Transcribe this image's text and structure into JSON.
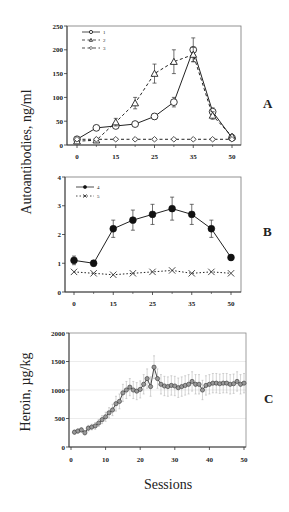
{
  "figure": {
    "ylabel_top": "Autoantibodies, ng/ml",
    "ylabel_bottom": "Heroin, µg/kg",
    "xlabel": "Sessions",
    "panel_letters": [
      "A",
      "B",
      "C"
    ]
  },
  "chart_data": [
    {
      "panel": "A",
      "type": "line",
      "title": "",
      "xlabel": "",
      "ylabel": "Autoantibodies, ng/ml",
      "ylim": [
        0,
        250
      ],
      "yticks": [
        0,
        50,
        100,
        150,
        200,
        250
      ],
      "xtick_labels": [
        "0",
        "15",
        "25",
        "35",
        "50"
      ],
      "xtick_positions": [
        0,
        2,
        4,
        6,
        8
      ],
      "n_points": 9,
      "grid": false,
      "legend_position": "upper left",
      "series": [
        {
          "name": "1",
          "marker": "open-circle",
          "line": "solid",
          "values": [
            12,
            36,
            40,
            44,
            60,
            90,
            200,
            70,
            15
          ],
          "errors": [
            4,
            4,
            5,
            4,
            6,
            10,
            25,
            8,
            4
          ]
        },
        {
          "name": "2",
          "marker": "open-triangle",
          "line": "dashed",
          "values": [
            8,
            10,
            48,
            88,
            150,
            175,
            190,
            62,
            18
          ],
          "errors": [
            3,
            3,
            8,
            12,
            20,
            25,
            15,
            8,
            4
          ]
        },
        {
          "name": "3",
          "marker": "filled-diamond",
          "line": "dashed",
          "values": [
            12,
            12,
            12,
            12,
            12,
            12,
            12,
            12,
            12
          ],
          "errors": [
            2,
            2,
            2,
            2,
            2,
            2,
            2,
            2,
            2
          ]
        }
      ]
    },
    {
      "panel": "B",
      "type": "line",
      "title": "",
      "xlabel": "",
      "ylabel": "Autoantibodies, ng/ml",
      "ylim": [
        0,
        4
      ],
      "yticks": [
        0,
        1,
        2,
        3,
        4
      ],
      "xtick_labels": [
        "0",
        "15",
        "25",
        "35",
        "50"
      ],
      "xtick_positions": [
        0,
        2,
        4,
        6,
        8
      ],
      "n_points": 9,
      "grid": false,
      "legend_position": "upper left",
      "series": [
        {
          "name": "4",
          "marker": "filled-circle",
          "line": "solid",
          "values": [
            1.1,
            1.0,
            2.2,
            2.5,
            2.7,
            2.9,
            2.7,
            2.2,
            1.2
          ],
          "errors": [
            0.15,
            0.1,
            0.3,
            0.35,
            0.35,
            0.4,
            0.35,
            0.3,
            0.1
          ]
        },
        {
          "name": "5",
          "marker": "x",
          "line": "dotted",
          "values": [
            0.7,
            0.65,
            0.6,
            0.65,
            0.7,
            0.75,
            0.65,
            0.7,
            0.65
          ],
          "errors": [
            0,
            0,
            0,
            0,
            0,
            0,
            0,
            0,
            0
          ]
        }
      ]
    },
    {
      "panel": "C",
      "type": "line",
      "title": "",
      "xlabel": "Sessions",
      "ylabel": "Heroin, µg/kg",
      "ylim": [
        0,
        2000
      ],
      "xlim": [
        0,
        50
      ],
      "yticks": [
        0,
        500,
        1000,
        1500,
        2000
      ],
      "xticks": [
        0,
        10,
        20,
        30,
        40,
        50
      ],
      "grid": true,
      "series": [
        {
          "name": "heroin intake",
          "marker": "filled-circle-gray",
          "line": "solid",
          "x": [
            1,
            2,
            3,
            4,
            5,
            6,
            7,
            8,
            9,
            10,
            11,
            12,
            13,
            14,
            15,
            16,
            17,
            18,
            19,
            20,
            21,
            22,
            23,
            24,
            25,
            26,
            27,
            28,
            29,
            30,
            31,
            32,
            33,
            34,
            35,
            36,
            37,
            38,
            39,
            40,
            41,
            42,
            43,
            44,
            45,
            46,
            47,
            48,
            49,
            50
          ],
          "values": [
            260,
            280,
            300,
            250,
            330,
            350,
            370,
            420,
            480,
            530,
            600,
            650,
            760,
            800,
            950,
            1000,
            1050,
            1000,
            980,
            1010,
            1100,
            1200,
            1060,
            1400,
            1200,
            1100,
            1070,
            1060,
            1080,
            1070,
            1040,
            1060,
            1080,
            1100,
            1150,
            1100,
            1100,
            1000,
            1080,
            1100,
            1120,
            1120,
            1110,
            1120,
            1120,
            1100,
            1110,
            1150,
            1100,
            1120
          ],
          "errors": [
            40,
            40,
            40,
            40,
            50,
            50,
            60,
            60,
            70,
            80,
            90,
            100,
            130,
            130,
            150,
            150,
            150,
            150,
            150,
            150,
            170,
            170,
            170,
            200,
            170,
            170,
            170,
            170,
            170,
            170,
            170,
            170,
            170,
            170,
            170,
            170,
            170,
            170,
            170,
            170,
            170,
            170,
            170,
            170,
            170,
            170,
            170,
            170,
            170,
            170
          ]
        }
      ]
    }
  ]
}
